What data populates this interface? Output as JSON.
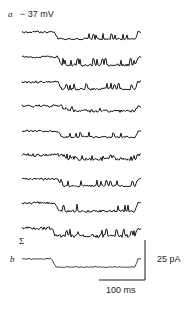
{
  "figure": {
    "panel_a_label": "a",
    "holding_potential": "− 37 mV",
    "sum_symbol": "Σ",
    "panel_b_label": "b",
    "current_scale": "25 pA",
    "time_scale": "100 ms"
  },
  "chart_data": {
    "type": "line",
    "title": "",
    "xlabel": "Time",
    "ylabel": "Current",
    "scale_bars": {
      "time": "100 ms",
      "current": "25 pA"
    },
    "grid": false,
    "legend": null,
    "traces_panel_a": [
      {
        "baseline_y": 32,
        "step_start_frac": 0.27,
        "open_level": 7,
        "noise": 1.0,
        "seed": 1
      },
      {
        "baseline_y": 57,
        "step_start_frac": 0.3,
        "open_level": 8,
        "noise": 1.2,
        "seed": 2
      },
      {
        "baseline_y": 82,
        "step_start_frac": 0.3,
        "open_level": 7,
        "noise": 1.2,
        "seed": 3
      },
      {
        "baseline_y": 106,
        "step_start_frac": 0.33,
        "open_level": 5,
        "noise": 1.4,
        "seed": 4
      },
      {
        "baseline_y": 131,
        "step_start_frac": 0.3,
        "open_level": 6,
        "noise": 1.0,
        "seed": 5
      },
      {
        "baseline_y": 155,
        "step_start_frac": 0.35,
        "open_level": 4,
        "noise": 1.6,
        "seed": 6
      },
      {
        "baseline_y": 179,
        "step_start_frac": 0.3,
        "open_level": 7,
        "noise": 1.0,
        "seed": 7
      },
      {
        "baseline_y": 203,
        "step_start_frac": 0.28,
        "open_level": 8,
        "noise": 1.3,
        "seed": 8
      },
      {
        "baseline_y": 228,
        "step_start_frac": 0.25,
        "open_level": 8,
        "noise": 1.6,
        "seed": 9
      }
    ],
    "trace_panel_b": {
      "baseline_y": 259,
      "step_start_frac": 0.25,
      "open_level": 8,
      "noise": 0.5,
      "seed": 20
    },
    "x_range_px": [
      22,
      141
    ],
    "scale_bar_px": {
      "vertical_x": 145,
      "vertical_y": [
        240,
        280
      ],
      "horizontal_y": 280,
      "horizontal_x": [
        99,
        145
      ]
    }
  }
}
